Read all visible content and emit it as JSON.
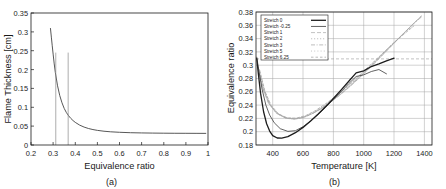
{
  "figure": {
    "panel_a_caption": "(a)",
    "panel_b_caption": "(b)"
  },
  "chart_data": [
    {
      "type": "line",
      "panel": "(a)",
      "title": "",
      "xlabel": "Equivalence ratio",
      "ylabel": "Flame Thickness [cm]",
      "xlim": [
        0.2,
        1.0
      ],
      "ylim": [
        0,
        0.35
      ],
      "xticks": [
        "0.2",
        "0.3",
        "0.4",
        "0.5",
        "0.6",
        "0.7",
        "0.8",
        "0.9",
        "1"
      ],
      "xtick_values": [
        0.2,
        0.3,
        0.4,
        0.5,
        0.6,
        0.7,
        0.8,
        0.9,
        1.0
      ],
      "yticks": [
        "0",
        "0.05",
        "0.1",
        "0.15",
        "0.2",
        "0.25",
        "0.3",
        "0.35"
      ],
      "ytick_values": [
        0,
        0.05,
        0.1,
        0.15,
        0.2,
        0.25,
        0.3,
        0.35
      ],
      "grid": false,
      "legend": "none",
      "series": [
        {
          "name": "Flame thickness",
          "x": [
            0.288,
            0.292,
            0.296,
            0.3,
            0.305,
            0.31,
            0.32,
            0.33,
            0.34,
            0.35,
            0.36,
            0.37,
            0.38,
            0.39,
            0.4,
            0.42,
            0.44,
            0.46,
            0.48,
            0.5,
            0.53,
            0.56,
            0.6,
            0.65,
            0.7,
            0.75,
            0.8,
            0.85,
            0.9,
            0.95,
            0.99
          ],
          "values": [
            0.309,
            0.286,
            0.263,
            0.241,
            0.215,
            0.192,
            0.157,
            0.131,
            0.112,
            0.097,
            0.086,
            0.0775,
            0.0705,
            0.0648,
            0.06,
            0.0527,
            0.0475,
            0.0437,
            0.0409,
            0.0388,
            0.0365,
            0.035,
            0.0337,
            0.0326,
            0.032,
            0.0316,
            0.0313,
            0.0311,
            0.031,
            0.0309,
            0.0308
          ]
        }
      ],
      "annotations": [
        {
          "type": "vline",
          "x": 0.312,
          "y_from": 0.0,
          "y_to": 0.245
        },
        {
          "type": "vline",
          "x": 0.368,
          "y_from": 0.0,
          "y_to": 0.245
        }
      ]
    },
    {
      "type": "line",
      "panel": "(b)",
      "title": "",
      "xlabel": "Temperature [K]",
      "ylabel": "Equivalence ratio",
      "xlim": [
        290,
        1450
      ],
      "ylim": [
        0.18,
        0.38
      ],
      "xticks": [
        "400",
        "600",
        "800",
        "1000",
        "1200",
        "1400"
      ],
      "xtick_values": [
        400,
        600,
        800,
        1000,
        1200,
        1400
      ],
      "yticks": [
        "0.18",
        "0.2",
        "0.22",
        "0.24",
        "0.26",
        "0.28",
        "0.3",
        "0.32",
        "0.34",
        "0.36",
        "0.38"
      ],
      "ytick_values": [
        0.18,
        0.2,
        0.22,
        0.24,
        0.26,
        0.28,
        0.3,
        0.32,
        0.34,
        0.36,
        0.38
      ],
      "grid": true,
      "legend_position": "upper-left",
      "legend_title": "",
      "series": [
        {
          "name": "Stretch  0",
          "style": "solid-dark",
          "x": [
            295,
            305,
            320,
            340,
            360,
            380,
            400,
            430,
            460,
            500,
            550,
            600,
            650,
            700,
            750,
            800,
            850,
            900,
            950,
            1000,
            1050,
            1100,
            1150,
            1200
          ],
          "values": [
            0.31,
            0.288,
            0.258,
            0.23,
            0.212,
            0.201,
            0.194,
            0.1905,
            0.1903,
            0.1925,
            0.1985,
            0.2065,
            0.216,
            0.2265,
            0.238,
            0.25,
            0.2625,
            0.2755,
            0.2885,
            0.2915,
            0.298,
            0.302,
            0.3065,
            0.3105
          ]
        },
        {
          "name": "Stretch  -0.25",
          "style": "solid-dark2",
          "x": [
            295,
            310,
            330,
            355,
            380,
            410,
            450,
            500,
            550,
            600,
            650,
            700,
            750,
            800,
            850,
            900,
            950,
            1000,
            1050,
            1100,
            1150
          ],
          "values": [
            0.312,
            0.29,
            0.264,
            0.24,
            0.225,
            0.2135,
            0.2045,
            0.2005,
            0.2015,
            0.2075,
            0.216,
            0.226,
            0.237,
            0.2485,
            0.26,
            0.272,
            0.283,
            0.2855,
            0.2905,
            0.2935,
            0.287
          ]
        },
        {
          "name": "Stretch  1",
          "style": "dash-gray",
          "x": [
            300,
            330,
            370,
            420,
            480,
            540,
            600,
            660,
            720,
            780,
            840,
            900,
            960,
            1020,
            1080,
            1140,
            1200,
            1260,
            1320,
            1380
          ],
          "values": [
            0.3,
            0.268,
            0.244,
            0.229,
            0.2215,
            0.2195,
            0.2215,
            0.227,
            0.2345,
            0.244,
            0.2545,
            0.266,
            0.2785,
            0.2915,
            0.305,
            0.319,
            0.333,
            0.347,
            0.361,
            0.374
          ]
        },
        {
          "name": "Stretch  2",
          "style": "dot-gray",
          "x": [
            300,
            335,
            375,
            425,
            485,
            545,
            605,
            665,
            725,
            785,
            845,
            905,
            965,
            1025,
            1085,
            1145,
            1205,
            1265,
            1325,
            1385
          ],
          "values": [
            0.298,
            0.266,
            0.2425,
            0.228,
            0.2205,
            0.219,
            0.2215,
            0.2275,
            0.2355,
            0.245,
            0.256,
            0.2675,
            0.28,
            0.293,
            0.3065,
            0.3205,
            0.3345,
            0.3485,
            0.362,
            0.375
          ]
        },
        {
          "name": "Stretch  3",
          "style": "dashdot-gray",
          "x": [
            305,
            340,
            380,
            430,
            490,
            550,
            610,
            670,
            730,
            790,
            850,
            910,
            970,
            1030,
            1090,
            1150,
            1210,
            1270,
            1330,
            1385
          ],
          "values": [
            0.296,
            0.264,
            0.241,
            0.227,
            0.22,
            0.219,
            0.222,
            0.2285,
            0.2365,
            0.2465,
            0.2575,
            0.2695,
            0.282,
            0.295,
            0.3085,
            0.3225,
            0.336,
            0.3495,
            0.3625,
            0.3735
          ]
        },
        {
          "name": "Stretch  5",
          "style": "dot2-gray",
          "x": [
            310,
            345,
            385,
            435,
            495,
            555,
            615,
            675,
            735,
            795,
            855,
            915,
            975,
            1035,
            1095,
            1155,
            1215,
            1275,
            1330
          ],
          "values": [
            0.294,
            0.262,
            0.24,
            0.2265,
            0.22,
            0.2195,
            0.223,
            0.23,
            0.2385,
            0.2485,
            0.26,
            0.272,
            0.2845,
            0.2975,
            0.311,
            0.3245,
            0.3375,
            0.35,
            0.3605
          ]
        },
        {
          "name": "Stretch  6.25",
          "style": "dash2-gray",
          "x": [
            315,
            350,
            390,
            440,
            500,
            560,
            620,
            680,
            740,
            800,
            860,
            920,
            980,
            1040,
            1100,
            1160,
            1220,
            1280,
            1330
          ],
          "values": [
            0.292,
            0.26,
            0.2395,
            0.2265,
            0.2205,
            0.2205,
            0.2245,
            0.2315,
            0.2405,
            0.2505,
            0.262,
            0.274,
            0.2865,
            0.2995,
            0.3125,
            0.3255,
            0.338,
            0.3495,
            0.359
          ]
        }
      ],
      "annotations": [
        {
          "type": "hline",
          "y": 0.3095,
          "label": ""
        }
      ]
    }
  ],
  "colors": {
    "axis": "#1a1a1a",
    "grid": "#8e8e8e",
    "curve_dark": "#2b2b2b",
    "curve_gray": "#9a9a9a",
    "background": "#ffffff"
  }
}
